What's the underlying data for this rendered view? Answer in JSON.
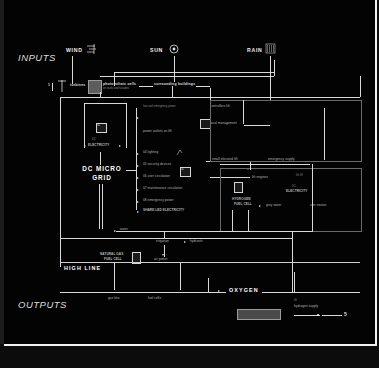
{
  "meta": {
    "bg_color": "#030303",
    "line_color": "#d8d8d8",
    "accent_color": "#ffffff"
  },
  "headers": {
    "inputs": "INPUTS",
    "outputs": "OUTPUTS"
  },
  "sources": [
    {
      "label": "WIND",
      "icon": "wind-lines-icon"
    },
    {
      "label": "SUN",
      "icon": "sun-circle-icon"
    },
    {
      "label": "RAIN",
      "icon": "rain-drops-icon"
    }
  ],
  "generators": [
    {
      "label": "turbines",
      "icon": "wind-turbine-icon"
    },
    {
      "label": "photovoltaic cells",
      "sub": "on roofs and facades",
      "icon": "pv-array-icon"
    },
    {
      "label": "surrounding buildings",
      "icon": "buildings-icon"
    }
  ],
  "hub": {
    "line1": "DC MICRO",
    "line2": "GRID"
  },
  "buses": {
    "electricity_left": "DC\nELECTRICITY",
    "electricity_right": "DC\nELECTRICITY",
    "oxygen": "OXYGEN",
    "high_line": "HIGH LINE",
    "natural_gas": "NATURAL GAS\nFUEL CELL",
    "hydrogen": "HYDROGEN\nFUEL CELL"
  },
  "loads_left": [
    "low roof emergency power",
    "power outlets on lift",
    "lighting",
    "security devices",
    "user circulation",
    "maintenance circulation",
    "emergency power",
    "SHARE LED ELECTRICITY"
  ],
  "loads_right": [
    "controllers lift",
    "local management",
    "small elevated lift",
    "emergency supply",
    "lift engines",
    "grey water",
    "rain station"
  ],
  "footer_nodes": [
    "water",
    "irrigation",
    "hydrants",
    "air power",
    "gas line",
    "fuel cells",
    "hydrogen supply"
  ],
  "annotations": {
    "stack_1": "1L",
    "stack_2": "1L",
    "stack_3": "1",
    "terminal": "5"
  }
}
